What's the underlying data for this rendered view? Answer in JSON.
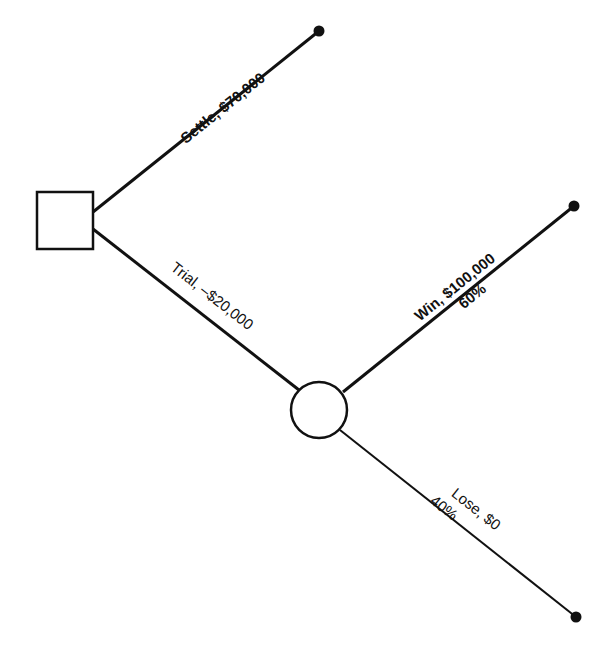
{
  "diagram": {
    "type": "decision-tree",
    "decision_node": {
      "shape": "square",
      "label": ""
    },
    "chance_node": {
      "shape": "circle",
      "label": ""
    },
    "branches": {
      "settle": {
        "label": "Settle, $70,000"
      },
      "trial": {
        "label": "Trial, –$20,000"
      },
      "win": {
        "label": "Win, $100,000",
        "probability": "60%"
      },
      "lose": {
        "label": "Lose, $0",
        "probability": "40%"
      }
    },
    "colors": {
      "line": "#111111",
      "background": "#ffffff",
      "terminal": "#111111"
    }
  }
}
